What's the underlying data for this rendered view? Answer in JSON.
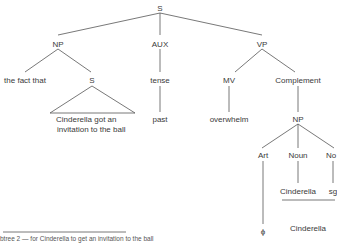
{
  "tree": {
    "root": "S",
    "np": "NP",
    "aux": "AUX",
    "vp": "VP",
    "the_fact_that": "the fact that",
    "embedded_s": "S",
    "embedded_line1": "Cinderella got an",
    "embedded_line2": "invitation to the ball",
    "tense": "tense",
    "past": "past",
    "mv": "MV",
    "overwhelm": "overwhelm",
    "complement": "Complement",
    "comp_np": "NP",
    "art": "Art",
    "noun": "Noun",
    "number": "No",
    "noun_value": "Cinderella",
    "number_value": "sg",
    "art_value": "ϕ",
    "surface": "Cinderella"
  },
  "caption": "btree 2 — for Cinderella to get an invitation to the ball"
}
